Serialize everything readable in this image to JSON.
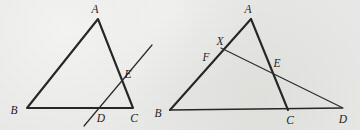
{
  "figure": {
    "background_color": "#e9e9e7",
    "stroke_color": "#262626",
    "label_color": "#1d1d1d",
    "caption": "",
    "panels": [
      {
        "name": "left-panel",
        "description": "Triangle ABC with a transversal line crossing side AC at E and base BC at D",
        "vertices": [
          {
            "id": "A",
            "label": "A",
            "x": 98,
            "y": 19,
            "label_x": 95,
            "label_y": 13
          },
          {
            "id": "B",
            "label": "B",
            "x": 27,
            "y": 108,
            "label_x": 14,
            "label_y": 114
          },
          {
            "id": "C",
            "label": "C",
            "x": 133,
            "y": 108,
            "label_x": 133,
            "label_y": 121
          },
          {
            "id": "D",
            "label": "D",
            "x": 99,
            "y": 108,
            "label_x": 100,
            "label_y": 121
          },
          {
            "id": "E",
            "label": "E",
            "x": 121,
            "y": 74,
            "label_x": 126,
            "label_y": 78
          }
        ],
        "segments": [
          {
            "name": "side-AB",
            "from": "A",
            "to": "B",
            "weight": "heavy"
          },
          {
            "name": "side-AC",
            "from": "A",
            "to": "C",
            "weight": "heavy"
          },
          {
            "name": "side-BC",
            "from": "B",
            "to": "C",
            "weight": "heavy"
          }
        ],
        "lines": [
          {
            "name": "transversal-line",
            "x1": 84,
            "y1": 126,
            "x2": 152,
            "y2": 45,
            "weight": "light"
          }
        ]
      },
      {
        "name": "right-panel",
        "description": "Triangle ABC with base extended to D and a line from X on AB through E to D, plus point F on AB",
        "vertices": [
          {
            "id": "A",
            "label": "A",
            "x": 251,
            "y": 19,
            "label_x": 248,
            "label_y": 13
          },
          {
            "id": "B",
            "label": "B",
            "x": 170,
            "y": 110,
            "label_x": 157,
            "label_y": 116
          },
          {
            "id": "C",
            "label": "C",
            "x": 288,
            "y": 110,
            "label_x": 289,
            "label_y": 123
          },
          {
            "id": "D",
            "label": "D",
            "x": 342,
            "y": 108,
            "label_x": 342,
            "label_y": 122
          },
          {
            "id": "E",
            "label": "E",
            "x": 271,
            "y": 70,
            "label_x": 275,
            "label_y": 67
          },
          {
            "id": "X",
            "label": "X",
            "x": 224,
            "y": 48,
            "label_x": 220,
            "label_y": 45
          },
          {
            "id": "F",
            "label": "F",
            "x": 215,
            "y": 58,
            "label_x": 206,
            "label_y": 60
          }
        ],
        "segments": [
          {
            "name": "side-AB",
            "from": "A",
            "to": "B",
            "weight": "heavy"
          },
          {
            "name": "side-AC",
            "from": "A",
            "to": "C",
            "weight": "heavy"
          },
          {
            "name": "side-BC",
            "from": "B",
            "to": "C",
            "weight": "heavy"
          }
        ],
        "lines": [
          {
            "name": "cevian-line-X-to-D",
            "x1": 222,
            "y1": 49,
            "x2": 342,
            "y2": 108,
            "weight": "light"
          },
          {
            "name": "base-extension-C-to-D",
            "x1": 288,
            "y1": 110,
            "x2": 342,
            "y2": 108,
            "weight": "light"
          },
          {
            "name": "segment-A-to-C-through-E",
            "x1": 251,
            "y1": 19,
            "x2": 288,
            "y2": 110,
            "weight": "heavy"
          }
        ]
      }
    ]
  }
}
